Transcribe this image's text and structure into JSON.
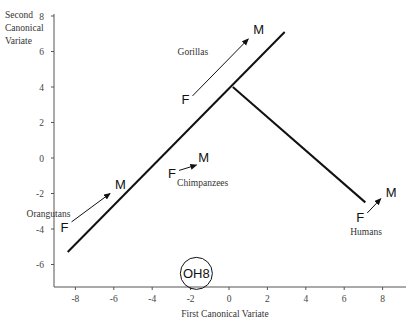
{
  "chart_data": {
    "type": "scatter",
    "title": "",
    "xlabel": "First Canonical Variate",
    "ylabel": "Second Canonical Variate",
    "ylabel_lines": [
      "Second",
      "Canonical",
      "Variate"
    ],
    "xlim": [
      -9,
      9.3
    ],
    "ylim": [
      -7.3,
      8.2
    ],
    "grid": false,
    "x_ticks": [
      "-8",
      "-6",
      "-4",
      "-2",
      "0",
      "2",
      "4",
      "6",
      "8"
    ],
    "y_ticks": [
      "8",
      "6",
      "4",
      "2",
      "0",
      "-2",
      "-4",
      "-6"
    ],
    "lines": [
      {
        "name": "main-axis-line",
        "from": [
          -8.4,
          -5.3
        ],
        "to": [
          2.9,
          7.1
        ]
      },
      {
        "name": "human-branch-line",
        "from": [
          0.2,
          4.0
        ],
        "to": [
          7.1,
          -2.5
        ]
      }
    ],
    "series": [
      {
        "name": "Gorillas",
        "female": [
          -1.9,
          3.5
        ],
        "male": [
          1.0,
          6.7
        ],
        "F_label": "F",
        "M_label": "M"
      },
      {
        "name": "Orangutans",
        "female": [
          -8.2,
          -3.6
        ],
        "male": [
          -6.2,
          -2.0
        ],
        "F_label": "F",
        "M_label": "M"
      },
      {
        "name": "Chimpanzees",
        "female": [
          -2.6,
          -0.7
        ],
        "male": [
          -1.7,
          -0.4
        ],
        "F_label": "F",
        "M_label": "M"
      },
      {
        "name": "Humans",
        "female": [
          7.2,
          -3.1
        ],
        "male": [
          7.9,
          -2.3
        ],
        "F_label": "F",
        "M_label": "M"
      }
    ],
    "annotations": [
      {
        "label": "OH8",
        "x": -1.7,
        "y": -6.5,
        "shape": "circle"
      }
    ]
  }
}
